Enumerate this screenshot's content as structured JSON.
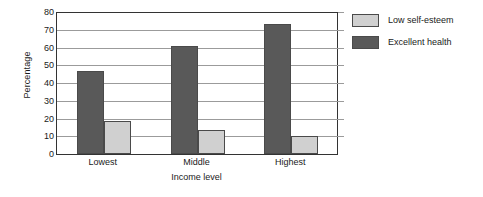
{
  "chart_data": {
    "type": "bar",
    "title": "",
    "subtitle": "",
    "xlabel": "Income level",
    "ylabel": "Percentage",
    "categories": [
      "Lowest",
      "Middle",
      "Highest"
    ],
    "series": [
      {
        "name": "Excellent health",
        "values": [
          47,
          61,
          73.5
        ],
        "color": "#595959"
      },
      {
        "name": "Low self-esteem",
        "values": [
          18.5,
          13.5,
          10
        ],
        "color": "#d0d0d0"
      }
    ],
    "ylim": [
      0,
      80
    ],
    "yticks": [
      0,
      10,
      20,
      30,
      40,
      50,
      60,
      70,
      80
    ],
    "ytick_labels": [
      "0",
      "10",
      "20",
      "30",
      "40",
      "50",
      "60",
      "70",
      "80"
    ],
    "grid": true,
    "grid_axis": "y",
    "legend_position": "right",
    "bar_order_in_group": [
      "Excellent health",
      "Low self-esteem"
    ]
  },
  "legend": {
    "entries": [
      {
        "label": "Low self-esteem",
        "color": "#d0d0d0"
      },
      {
        "label": "Excellent health",
        "color": "#595959"
      }
    ]
  },
  "colors": {
    "excellent_health": "#595959",
    "low_self_esteem": "#d0d0d0",
    "axis": "#333333",
    "gridline": "#9b9b9b",
    "bar_outline": "#4a4a4a",
    "background": "#ffffff",
    "text": "#1a1a1a"
  }
}
